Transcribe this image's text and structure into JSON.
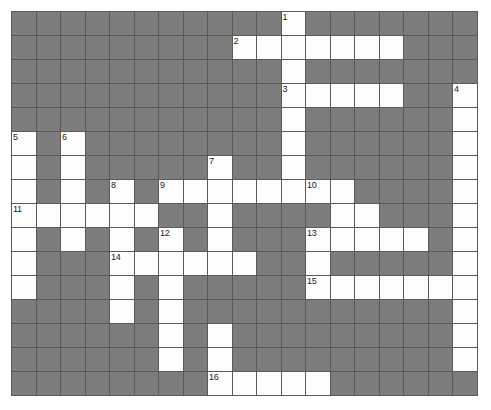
{
  "puzzle": {
    "title": "crossword-grid",
    "type": "crossword",
    "columns": 19,
    "rows": 16,
    "cell_width_px": 24.5,
    "cell_height_px": 24,
    "colors": {
      "block": "#7d7d7d",
      "open": "#fdfdfd",
      "grid_line": "#5a5a5a",
      "background": "#ffffff",
      "number_text": "#1b1b1b"
    },
    "legend": {
      "open_cell": "white letter cell",
      "block_cell": "gray blocked cell"
    },
    "clue_numbers": [
      {
        "number": "1",
        "row": 1,
        "col": 12
      },
      {
        "number": "2",
        "row": 2,
        "col": 10
      },
      {
        "number": "3",
        "row": 4,
        "col": 12
      },
      {
        "number": "4",
        "row": 4,
        "col": 19
      },
      {
        "number": "5",
        "row": 6,
        "col": 1
      },
      {
        "number": "6",
        "row": 6,
        "col": 3
      },
      {
        "number": "7",
        "row": 7,
        "col": 9
      },
      {
        "number": "8",
        "row": 8,
        "col": 5
      },
      {
        "number": "9",
        "row": 8,
        "col": 7
      },
      {
        "number": "10",
        "row": 8,
        "col": 13
      },
      {
        "number": "11",
        "row": 9,
        "col": 1
      },
      {
        "number": "12",
        "row": 10,
        "col": 7
      },
      {
        "number": "13",
        "row": 10,
        "col": 13
      },
      {
        "number": "14",
        "row": 11,
        "col": 5
      },
      {
        "number": "15",
        "row": 12,
        "col": 13
      },
      {
        "number": "16",
        "row": 16,
        "col": 9
      }
    ],
    "grid": [
      [
        "block",
        "block",
        "block",
        "block",
        "block",
        "block",
        "block",
        "block",
        "block",
        "block",
        "block",
        "open",
        "block",
        "block",
        "block",
        "block",
        "block",
        "block",
        "block"
      ],
      [
        "block",
        "block",
        "block",
        "block",
        "block",
        "block",
        "block",
        "block",
        "block",
        "open",
        "open",
        "open",
        "open",
        "open",
        "open",
        "open",
        "block",
        "block",
        "block"
      ],
      [
        "block",
        "block",
        "block",
        "block",
        "block",
        "block",
        "block",
        "block",
        "block",
        "block",
        "block",
        "open",
        "block",
        "block",
        "block",
        "block",
        "block",
        "block",
        "block"
      ],
      [
        "block",
        "block",
        "block",
        "block",
        "block",
        "block",
        "block",
        "block",
        "block",
        "block",
        "block",
        "open",
        "open",
        "open",
        "open",
        "open",
        "block",
        "block",
        "open"
      ],
      [
        "block",
        "block",
        "block",
        "block",
        "block",
        "block",
        "block",
        "block",
        "block",
        "block",
        "block",
        "open",
        "block",
        "block",
        "block",
        "block",
        "block",
        "block",
        "open"
      ],
      [
        "open",
        "block",
        "open",
        "block",
        "block",
        "block",
        "block",
        "block",
        "block",
        "block",
        "block",
        "open",
        "block",
        "block",
        "block",
        "block",
        "block",
        "block",
        "open"
      ],
      [
        "open",
        "block",
        "open",
        "block",
        "block",
        "block",
        "block",
        "block",
        "open",
        "block",
        "block",
        "open",
        "block",
        "block",
        "block",
        "block",
        "block",
        "block",
        "open"
      ],
      [
        "open",
        "block",
        "open",
        "block",
        "open",
        "block",
        "open",
        "open",
        "open",
        "open",
        "open",
        "open",
        "open",
        "open",
        "block",
        "block",
        "block",
        "block",
        "open"
      ],
      [
        "open",
        "open",
        "open",
        "open",
        "open",
        "open",
        "block",
        "block",
        "open",
        "block",
        "block",
        "block",
        "block",
        "open",
        "open",
        "block",
        "block",
        "block",
        "open"
      ],
      [
        "open",
        "block",
        "open",
        "block",
        "open",
        "block",
        "open",
        "block",
        "open",
        "block",
        "block",
        "block",
        "open",
        "open",
        "open",
        "open",
        "open",
        "block",
        "open"
      ],
      [
        "open",
        "block",
        "block",
        "block",
        "open",
        "open",
        "open",
        "open",
        "open",
        "open",
        "block",
        "block",
        "open",
        "block",
        "block",
        "block",
        "block",
        "block",
        "open"
      ],
      [
        "open",
        "block",
        "block",
        "block",
        "open",
        "block",
        "open",
        "block",
        "block",
        "block",
        "block",
        "block",
        "open",
        "open",
        "open",
        "open",
        "open",
        "open",
        "open"
      ],
      [
        "block",
        "block",
        "block",
        "block",
        "open",
        "block",
        "open",
        "block",
        "block",
        "block",
        "block",
        "block",
        "block",
        "block",
        "block",
        "block",
        "block",
        "block",
        "open"
      ],
      [
        "block",
        "block",
        "block",
        "block",
        "block",
        "block",
        "open",
        "block",
        "open",
        "block",
        "block",
        "block",
        "block",
        "block",
        "block",
        "block",
        "block",
        "block",
        "open"
      ],
      [
        "block",
        "block",
        "block",
        "block",
        "block",
        "block",
        "open",
        "block",
        "open",
        "block",
        "block",
        "block",
        "block",
        "block",
        "block",
        "block",
        "block",
        "block",
        "open"
      ],
      [
        "block",
        "block",
        "block",
        "block",
        "block",
        "block",
        "block",
        "block",
        "open",
        "open",
        "open",
        "open",
        "open",
        "block",
        "block",
        "block",
        "block",
        "block",
        "block"
      ]
    ]
  }
}
